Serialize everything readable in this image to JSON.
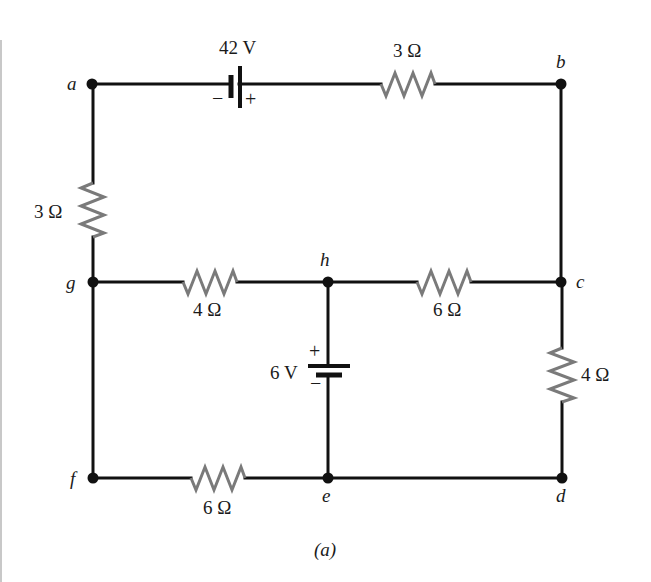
{
  "figure": {
    "caption": "(a)"
  },
  "nodes": {
    "a": "a",
    "b": "b",
    "c": "c",
    "d": "d",
    "e": "e",
    "f": "f",
    "g": "g",
    "h": "h"
  },
  "sources": {
    "top": {
      "label": "42 V",
      "neg": "−",
      "pos": "+"
    },
    "middle": {
      "label": "6 V",
      "neg": "−",
      "pos": "+"
    }
  },
  "resistors": {
    "ab": "3 Ω",
    "ag": "3 Ω",
    "gh": "4 Ω",
    "hc": "6 Ω",
    "cd": "4 Ω",
    "fe": "6 Ω"
  },
  "colors": {
    "wire": "#111111",
    "resistor": "#7a7a7a"
  }
}
